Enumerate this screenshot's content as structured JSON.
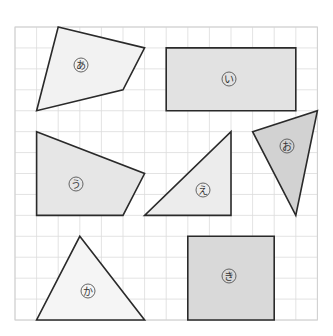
{
  "figure": {
    "grid": {
      "origin_x": 15,
      "origin_y": 27,
      "cols": 14,
      "rows": 14,
      "cell_w": 21.6,
      "cell_h": 20.93,
      "line_color": "#dcdcdc"
    },
    "shapes": [
      {
        "id": "a",
        "label": "あ",
        "type": "quadrilateral",
        "points": [
          [
            2,
            0
          ],
          [
            6,
            1
          ],
          [
            5,
            3
          ],
          [
            1,
            4
          ]
        ],
        "fill": "#f2f2f2",
        "label_pos": [
          81,
          65
        ]
      },
      {
        "id": "i",
        "label": "い",
        "type": "rectangle",
        "points": [
          [
            7,
            1
          ],
          [
            13,
            1
          ],
          [
            13,
            4
          ],
          [
            7,
            4
          ]
        ],
        "fill": "#e2e2e2",
        "label_pos": [
          229,
          79
        ]
      },
      {
        "id": "u",
        "label": "う",
        "type": "quadrilateral",
        "points": [
          [
            1,
            5
          ],
          [
            6,
            7
          ],
          [
            5,
            9
          ],
          [
            1,
            9
          ]
        ],
        "fill": "#e6e6e6",
        "label_pos": [
          76,
          184
        ]
      },
      {
        "id": "e",
        "label": "え",
        "type": "right-triangle",
        "points": [
          [
            10,
            5
          ],
          [
            10,
            9
          ],
          [
            6,
            9
          ]
        ],
        "fill": "#ececec",
        "label_pos": [
          203,
          190
        ]
      },
      {
        "id": "o",
        "label": "お",
        "type": "triangle",
        "points": [
          [
            11,
            5
          ],
          [
            14,
            4
          ],
          [
            13,
            9
          ]
        ],
        "fill": "#d2d2d2",
        "label_pos": [
          287,
          146
        ]
      },
      {
        "id": "ka",
        "label": "か",
        "type": "triangle",
        "points": [
          [
            3,
            10
          ],
          [
            6,
            14
          ],
          [
            1,
            14
          ]
        ],
        "fill": "#f5f5f5",
        "label_pos": [
          88,
          291
        ]
      },
      {
        "id": "ki",
        "label": "き",
        "type": "square",
        "points": [
          [
            8,
            10
          ],
          [
            12,
            10
          ],
          [
            12,
            14
          ],
          [
            8,
            14
          ]
        ],
        "fill": "#d9d9d9",
        "label_pos": [
          229,
          276
        ]
      }
    ]
  }
}
